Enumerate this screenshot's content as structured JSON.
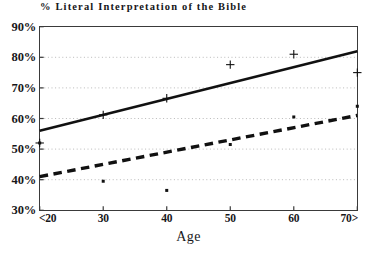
{
  "chart_data": {
    "type": "line",
    "title": "% Literal Interpretation of the Bible",
    "xlabel": "Age",
    "ylabel": "",
    "categories": [
      "<20",
      "30",
      "40",
      "50",
      "60",
      "70>"
    ],
    "x": [
      20,
      30,
      40,
      50,
      60,
      70
    ],
    "xlim": [
      20,
      70
    ],
    "ylim": [
      30,
      90
    ],
    "ytick_labels": [
      "30%",
      "40%",
      "50%",
      "60%",
      "70%",
      "80%",
      "90%"
    ],
    "ytick_values": [
      30,
      40,
      50,
      60,
      70,
      80,
      90
    ],
    "xtick_labels": [
      "<20",
      "30",
      "40",
      "50",
      "60",
      "70>"
    ],
    "grid": "horizontal-dotted",
    "legend": "none",
    "series": [
      {
        "name": "solid-trend",
        "style": "solid",
        "marker": "plus",
        "trend_start": 56.0,
        "trend_end": 82.0,
        "values": [
          52.0,
          61.2,
          66.6,
          77.6,
          81.0,
          75.0
        ]
      },
      {
        "name": "dashed-trend",
        "style": "dashed",
        "marker": "square-dot",
        "trend_start": 41.0,
        "trend_end": 61.0,
        "values": [
          52.0,
          39.5,
          36.5,
          51.5,
          60.5,
          64.0
        ]
      }
    ]
  },
  "colors": {
    "line": "#111111",
    "axis": "#3a3a3a",
    "grid": "#b9b9b9",
    "text": "#17171a",
    "background": "#ffffff"
  }
}
